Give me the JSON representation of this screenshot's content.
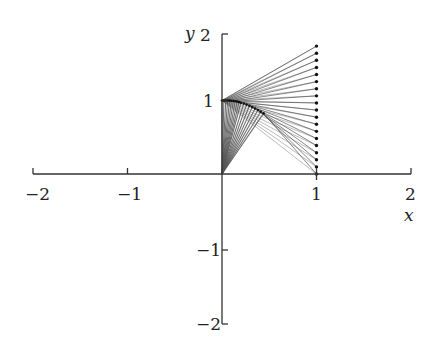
{
  "chart_data": {
    "type": "line",
    "title": "",
    "xlabel": "x",
    "ylabel": "y",
    "xlim": [
      -2,
      2
    ],
    "ylim": [
      -2,
      2
    ],
    "x_ticks": [
      -2,
      -1,
      1,
      2
    ],
    "y_ticks": [
      -2,
      -1,
      1,
      2
    ],
    "x_tick_labels": [
      "−2",
      "−1",
      "1",
      "2"
    ],
    "y_tick_labels": [
      "−2",
      "−1",
      "1",
      "2"
    ],
    "grid": false,
    "legend": null,
    "line_color": "#555555",
    "dot_color": "#111111",
    "apex_point": [
      0,
      1
    ],
    "origin_point": [
      0,
      0
    ],
    "endpoints_x": 1,
    "endpoints_y": [
      1.74,
      1.643,
      1.547,
      1.45,
      1.353,
      1.257,
      1.16,
      1.063,
      0.967,
      0.87,
      0.773,
      0.677,
      0.58,
      0.483,
      0.387,
      0.29,
      0.193,
      0.097,
      0.0
    ],
    "curve_points": [
      [
        0.0,
        1.0
      ],
      [
        0.02,
        1.0
      ],
      [
        0.04,
        1.0
      ],
      [
        0.06,
        0.999
      ],
      [
        0.08,
        0.998
      ],
      [
        0.1,
        0.996
      ],
      [
        0.12,
        0.993
      ],
      [
        0.14,
        0.99
      ],
      [
        0.16,
        0.985
      ],
      [
        0.18,
        0.978
      ],
      [
        0.2,
        0.97
      ],
      [
        0.23,
        0.958
      ],
      [
        0.26,
        0.944
      ],
      [
        0.29,
        0.928
      ],
      [
        0.32,
        0.91
      ],
      [
        0.35,
        0.891
      ],
      [
        0.38,
        0.87
      ],
      [
        0.41,
        0.848
      ],
      [
        0.44,
        0.825
      ]
    ]
  },
  "axes": {
    "x_label": "x",
    "y_label": "y",
    "tick_labels": {
      "x_neg2": "−2",
      "x_neg1": "−1",
      "x_1": "1",
      "x_2": "2",
      "y_neg2": "−2",
      "y_neg1": "−1",
      "y_1": "1",
      "y_2": "2"
    }
  }
}
